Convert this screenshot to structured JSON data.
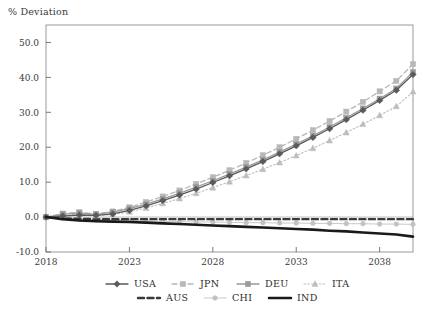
{
  "chart_data": {
    "type": "line",
    "title": "",
    "ylabel": "% Deviation",
    "xlabel": "",
    "xlim": [
      2018,
      2040
    ],
    "ylim": [
      -10.0,
      55.0
    ],
    "grid": false,
    "legend_position": "bottom",
    "y_ticks": [
      "50.0",
      "40.0",
      "30.0",
      "20.0",
      "10.0",
      "0.0",
      "-10.0"
    ],
    "y_tick_values": [
      50.0,
      40.0,
      30.0,
      20.0,
      10.0,
      0.0,
      -10.0
    ],
    "x_ticks": [
      "2018",
      "2023",
      "2028",
      "2033",
      "2038"
    ],
    "x_tick_values": [
      2018,
      2023,
      2028,
      2033,
      2038
    ],
    "x": [
      2018,
      2019,
      2020,
      2021,
      2022,
      2023,
      2024,
      2025,
      2026,
      2027,
      2028,
      2029,
      2030,
      2031,
      2032,
      2033,
      2034,
      2035,
      2036,
      2037,
      2038,
      2039,
      2040
    ],
    "series": [
      {
        "name": "USA",
        "marker": "diamond",
        "line_style": "solid",
        "color": "#5a5a5a",
        "values": [
          0.0,
          0.3,
          0.6,
          0.5,
          0.9,
          1.9,
          3.2,
          4.7,
          6.3,
          8.0,
          9.9,
          11.8,
          13.8,
          15.9,
          18.1,
          20.4,
          22.8,
          25.3,
          27.9,
          30.6,
          33.4,
          36.3,
          40.8
        ]
      },
      {
        "name": "JPN",
        "marker": "square",
        "line_style": "dashed",
        "color": "#b8b8b8",
        "values": [
          0.0,
          1.0,
          1.4,
          0.9,
          1.6,
          2.8,
          4.3,
          5.9,
          7.6,
          9.5,
          11.4,
          13.4,
          15.5,
          17.7,
          20.0,
          22.4,
          24.9,
          27.5,
          30.2,
          33.0,
          36.0,
          39.0,
          43.8
        ]
      },
      {
        "name": "DEU",
        "marker": "square",
        "line_style": "solid",
        "color": "#9a9a9a",
        "values": [
          0.0,
          0.8,
          1.2,
          0.8,
          1.4,
          2.4,
          3.7,
          5.2,
          6.8,
          8.6,
          10.4,
          12.3,
          14.3,
          16.4,
          18.6,
          20.9,
          23.3,
          25.8,
          28.4,
          31.1,
          33.9,
          36.8,
          41.5
        ]
      },
      {
        "name": "ITA",
        "marker": "triangle",
        "line_style": "dotted",
        "color": "#bdbdbd",
        "values": [
          0.0,
          0.5,
          0.8,
          0.4,
          0.7,
          1.5,
          2.6,
          3.9,
          5.3,
          6.8,
          8.4,
          10.1,
          11.9,
          13.7,
          15.6,
          17.6,
          19.7,
          21.9,
          24.2,
          26.6,
          29.1,
          31.7,
          35.9
        ]
      },
      {
        "name": "AUS",
        "marker": "none",
        "line_style": "dashed-thick",
        "color": "#3a3a3a",
        "values": [
          0.0,
          -0.4,
          -0.5,
          -0.6,
          -0.6,
          -0.6,
          -0.6,
          -0.6,
          -0.6,
          -0.6,
          -0.6,
          -0.6,
          -0.6,
          -0.6,
          -0.6,
          -0.6,
          -0.6,
          -0.6,
          -0.6,
          -0.6,
          -0.6,
          -0.6,
          -0.6
        ]
      },
      {
        "name": "CHI",
        "marker": "dot",
        "line_style": "solid-thin",
        "color": "#c2c2c2",
        "values": [
          0.0,
          -0.3,
          -0.6,
          -0.8,
          -0.9,
          -1.0,
          -1.1,
          -1.2,
          -1.3,
          -1.4,
          -1.4,
          -1.5,
          -1.6,
          -1.6,
          -1.7,
          -1.7,
          -1.8,
          -1.8,
          -1.9,
          -1.9,
          -2.0,
          -2.0,
          -2.1
        ]
      },
      {
        "name": "IND",
        "marker": "none",
        "line_style": "solid-thick",
        "color": "#1a1a1a",
        "values": [
          0.0,
          -0.6,
          -1.0,
          -1.2,
          -1.3,
          -1.4,
          -1.6,
          -1.8,
          -2.0,
          -2.2,
          -2.4,
          -2.6,
          -2.8,
          -3.0,
          -3.2,
          -3.4,
          -3.6,
          -3.9,
          -4.1,
          -4.4,
          -4.7,
          -5.0,
          -5.6
        ]
      }
    ],
    "legend_rows": [
      [
        "USA",
        "JPN",
        "DEU",
        "ITA"
      ],
      [
        "AUS",
        "CHI",
        "IND"
      ]
    ]
  }
}
